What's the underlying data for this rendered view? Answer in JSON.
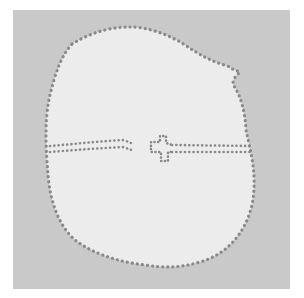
{
  "image": {
    "description": "Photograph of a pale rounded shape with a dotted outline, divided horizontally by a dotted line with a small cross notch, on a gray background",
    "colors": {
      "page_background": "#ffffff",
      "backdrop": "#c9c9c9",
      "shape_fill": "#ececec",
      "dots": "#8a8a8a"
    }
  }
}
